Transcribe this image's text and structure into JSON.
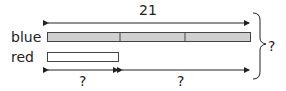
{
  "diagram": {
    "total_label": "21",
    "rows": [
      {
        "label": "blue",
        "units": 3,
        "fill": "#d0d0d0"
      },
      {
        "label": "red",
        "units": 1,
        "fill": "#ffffff"
      }
    ],
    "bottom_left_label": "?",
    "bottom_right_label": "?",
    "brace_label": "?"
  }
}
